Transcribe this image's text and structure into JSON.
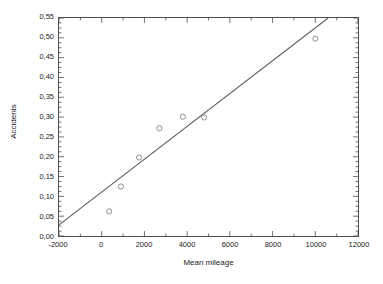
{
  "chart_data": {
    "type": "scatter",
    "title": "",
    "xlabel": "Mean mileage",
    "ylabel": "Accidents",
    "xlim": [
      -2000,
      12000
    ],
    "ylim": [
      0.0,
      0.55
    ],
    "grid": false,
    "legend": null,
    "decimal_separator": ",",
    "x_ticks": [
      -2000,
      0,
      2000,
      4000,
      6000,
      8000,
      10000,
      12000
    ],
    "x_tick_labels": [
      "-2000",
      "0",
      "2000",
      "4000",
      "6000",
      "8000",
      "10000",
      "12000"
    ],
    "x_minor_tick_step": 1000,
    "y_ticks": [
      0.0,
      0.05,
      0.1,
      0.15,
      0.2,
      0.25,
      0.3,
      0.35,
      0.4,
      0.45,
      0.5,
      0.55
    ],
    "y_tick_labels": [
      "0,00",
      "0,05",
      "0,10",
      "0,15",
      "0,20",
      "0,25",
      "0,30",
      "0,35",
      "0,40",
      "0,45",
      "0,50",
      "0,55"
    ],
    "y_minor_tick_step": 0.0125,
    "marker": "open-circle",
    "marker_color": "#808080",
    "line_color": "#595959",
    "frame_color": "#4d4d4d",
    "points": [
      {
        "x": 350,
        "y": 0.062
      },
      {
        "x": 900,
        "y": 0.125
      },
      {
        "x": 1750,
        "y": 0.198
      },
      {
        "x": 2700,
        "y": 0.272
      },
      {
        "x": 3800,
        "y": 0.301
      },
      {
        "x": 4800,
        "y": 0.299
      },
      {
        "x": 10000,
        "y": 0.498
      }
    ],
    "series": [
      {
        "name": "Accidents",
        "x": [
          350,
          900,
          1750,
          2700,
          3800,
          4800,
          10000
        ],
        "values": [
          0.062,
          0.125,
          0.198,
          0.272,
          0.301,
          0.299,
          0.498
        ]
      }
    ],
    "fit_line": {
      "type": "linear-regression",
      "slope": 4.15e-05,
      "intercept": 0.111,
      "x_start": -2000,
      "y_start": 0.028,
      "x_end": 10600,
      "y_end": 0.55
    }
  }
}
